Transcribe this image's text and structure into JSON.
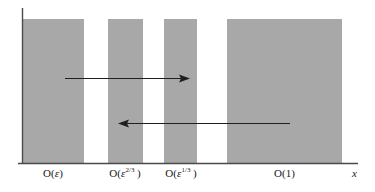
{
  "figure": {
    "type": "scaling-regions-diagram",
    "background_color": "#ffffff",
    "bar_fill_color": "#a8a8a8",
    "line_color": "#3a3a3a",
    "axis": {
      "x_label": "x",
      "x_axis_start": 22,
      "x_axis_end": 358,
      "baseline_y": 163,
      "y_axis_x": 22,
      "y_axis_top": 8
    },
    "regions": [
      {
        "name": "region-epsilon",
        "label_prefix": "O(",
        "label_var": "ε",
        "label_exponent": "",
        "label_suffix": ")",
        "label_text": "O(ε)",
        "x_start": 22,
        "x_end": 84,
        "top": 19,
        "label_center_x": 53,
        "label_y": 168
      },
      {
        "name": "region-epsilon-two-thirds",
        "label_prefix": "O(",
        "label_var": "ε",
        "label_exponent": "2/3",
        "label_suffix": ")",
        "label_text": "O(ε 2/3 )",
        "x_start": 108,
        "x_end": 143,
        "top": 19,
        "label_center_x": 125,
        "label_y": 168
      },
      {
        "name": "region-epsilon-one-third",
        "label_prefix": "O(",
        "label_var": "ε",
        "label_exponent": "1/3",
        "label_suffix": ")",
        "label_text": "O(ε 1/3 )",
        "x_start": 164,
        "x_end": 197,
        "top": 19,
        "label_center_x": 181,
        "label_y": 168
      },
      {
        "name": "region-one",
        "label_prefix": "O(",
        "label_var": "1",
        "label_exponent": "",
        "label_suffix": ")",
        "label_text": "O(1)",
        "x_start": 227,
        "x_end": 342,
        "top": 19,
        "label_center_x": 285,
        "label_y": 168
      }
    ],
    "arrows": [
      {
        "name": "arrow-rightward",
        "direction": "right",
        "tail_x": 65,
        "tip_x": 190,
        "y": 78
      },
      {
        "name": "arrow-leftward",
        "direction": "left",
        "tail_x": 290,
        "tip_x": 118,
        "y": 123
      }
    ]
  },
  "chart_data": {
    "type": "bar",
    "title": "",
    "xlabel": "x",
    "ylabel": "",
    "grid": false,
    "legend": null,
    "categories": [
      "O(ε)",
      "O(ε^{2/3})",
      "O(ε^{1/3})",
      "O(1)"
    ],
    "values": [
      1,
      1,
      1,
      1
    ],
    "bar_pixel_spans": [
      [
        22,
        84
      ],
      [
        108,
        143
      ],
      [
        164,
        197
      ],
      [
        227,
        342
      ]
    ],
    "annotations": [
      {
        "kind": "arrow",
        "direction": "right",
        "from_px": 65,
        "to_px": 190,
        "y_px": 78
      },
      {
        "kind": "arrow",
        "direction": "left",
        "from_px": 290,
        "to_px": 118,
        "y_px": 123
      }
    ]
  }
}
